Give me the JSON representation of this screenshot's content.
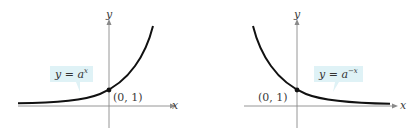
{
  "graphs": [
    {
      "id": "left",
      "equation": {
        "lhs": "y = a",
        "exponent": "x"
      },
      "point_label": "(0, 1)",
      "x_axis_label": "x",
      "y_axis_label": "y"
    },
    {
      "id": "right",
      "equation": {
        "lhs": "y = a",
        "exponent": "−x"
      },
      "point_label": "(0, 1)",
      "x_axis_label": "x",
      "y_axis_label": "y"
    }
  ],
  "colors": {
    "curve": "#111111",
    "axis": "#8a8a8a",
    "label_box": "#dff2f6"
  }
}
